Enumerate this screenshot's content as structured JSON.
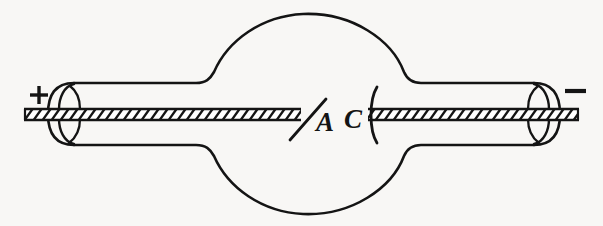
{
  "figure": {
    "description": "Spherical glass bulb with cylindrical side tubes, a slanted anode plate and a concave cathode plate",
    "background_color": "#f8f7f5",
    "ink_color": "#141414",
    "canvas": {
      "width": 603,
      "height": 226
    }
  },
  "labels": {
    "anode": {
      "text": "A",
      "name": "anode-label",
      "x": 316,
      "y": 131,
      "font_size": 27
    },
    "cathode": {
      "text": "C",
      "name": "cathode-label",
      "x": 357,
      "y": 128,
      "font_size": 27
    }
  },
  "terminals": {
    "positive": {
      "symbol": "+",
      "name": "positive-terminal-marker",
      "x": 38,
      "y": 95
    },
    "negative": {
      "symbol": "−",
      "name": "negative-terminal-marker",
      "x": 574,
      "y": 91
    }
  },
  "geometry": {
    "bulb": {
      "cx": 310,
      "cy": 113,
      "r": 100
    },
    "axis_y": 114,
    "rod": {
      "left_start_x": 24,
      "left_end_x": 300,
      "right_start_x": 369,
      "right_end_x": 579,
      "half_thickness": 5
    },
    "tube_left": {
      "x_start": 57,
      "x_end": 210,
      "half_height": 31
    },
    "tube_right": {
      "x_start": 410,
      "x_end": 549,
      "half_height": 31
    }
  }
}
